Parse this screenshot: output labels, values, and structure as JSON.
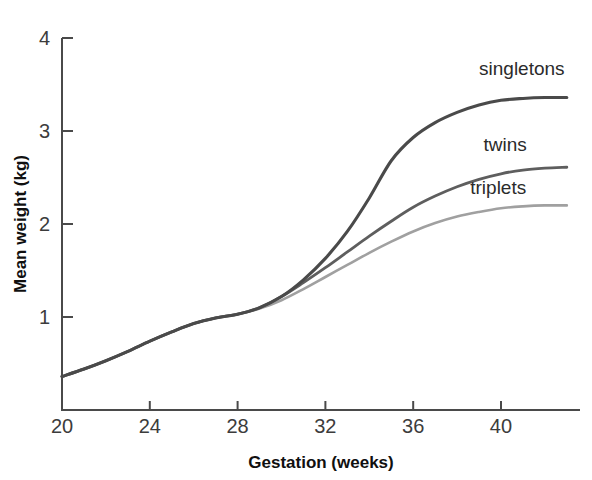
{
  "figure": {
    "cut_off_caption_fragment": "",
    "background_color": "#ffffff"
  },
  "chart_data": {
    "type": "line",
    "title": "",
    "subtitle": "",
    "xlabel": "Gestation (weeks)",
    "ylabel": "Mean weight (kg)",
    "xlim": [
      20,
      43.6
    ],
    "ylim": [
      0,
      4
    ],
    "xticks": [
      20,
      24,
      28,
      32,
      36,
      40
    ],
    "xtick_labels": [
      "20",
      "24",
      "28",
      "32",
      "36",
      "40"
    ],
    "yticks": [
      1,
      2,
      3,
      4
    ],
    "ytick_labels": [
      "1",
      "2",
      "3",
      "4"
    ],
    "grid": false,
    "legend_position": "inline-right-end-labels",
    "x": [
      20,
      21,
      22,
      23,
      24,
      25,
      26,
      27,
      28,
      29,
      30,
      31,
      32,
      33,
      34,
      35,
      36,
      37,
      38,
      39,
      40,
      41,
      42,
      43
    ],
    "series": [
      {
        "name": "singletons",
        "label": "singletons",
        "color": "#4a4a4a",
        "line_width": 3.1,
        "values": [
          0.36,
          0.44,
          0.53,
          0.63,
          0.74,
          0.84,
          0.93,
          0.99,
          1.03,
          1.1,
          1.22,
          1.4,
          1.63,
          1.92,
          2.28,
          2.68,
          2.93,
          3.09,
          3.2,
          3.28,
          3.33,
          3.35,
          3.36,
          3.36
        ]
      },
      {
        "name": "twins",
        "label": "twins",
        "color": "#5e5e5e",
        "line_width": 2.8,
        "values": [
          0.36,
          0.44,
          0.53,
          0.63,
          0.74,
          0.84,
          0.93,
          0.99,
          1.03,
          1.1,
          1.22,
          1.37,
          1.53,
          1.7,
          1.87,
          2.03,
          2.18,
          2.3,
          2.4,
          2.48,
          2.54,
          2.58,
          2.6,
          2.61
        ]
      },
      {
        "name": "triplets",
        "label": "triplets",
        "color": "#a0a0a0",
        "line_width": 2.6,
        "values": [
          0.36,
          0.44,
          0.53,
          0.63,
          0.74,
          0.84,
          0.93,
          0.99,
          1.03,
          1.09,
          1.18,
          1.3,
          1.43,
          1.56,
          1.69,
          1.81,
          1.92,
          2.01,
          2.08,
          2.13,
          2.17,
          2.19,
          2.2,
          2.2
        ]
      }
    ],
    "annotations": [
      {
        "text": "singletons",
        "x": 39.0,
        "y": 3.6
      },
      {
        "text": "twins",
        "x": 39.2,
        "y": 2.78
      },
      {
        "text": "triplets",
        "x": 38.6,
        "y": 2.32
      }
    ]
  }
}
